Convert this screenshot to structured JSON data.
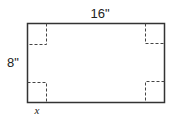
{
  "diagram": {
    "type": "rectangle-with-corner-cutouts",
    "width_label": "16\"",
    "height_label": "8\"",
    "cutout_label": "x",
    "colors": {
      "stroke": "#333333",
      "text": "#222222",
      "background": "#ffffff"
    }
  }
}
